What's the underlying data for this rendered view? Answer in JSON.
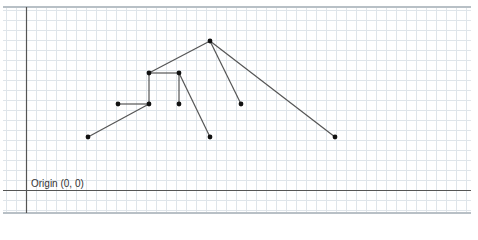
{
  "diagram": {
    "type": "tree-on-graph-paper",
    "origin_label": "Origin (0, 0)",
    "colors": {
      "grid_minor": "#dfe5ea",
      "grid_major": "#c9d2d9",
      "axis": "#555555",
      "border": "#b8c0c6",
      "edge": "#555555",
      "node": "#111111"
    },
    "grid": {
      "left": 3,
      "top": 7,
      "right": 471,
      "bottom": 213,
      "cell": 10
    },
    "axes": {
      "x": 26,
      "y": 190
    },
    "nodes": [
      {
        "id": "A",
        "x": 210,
        "y": 41
      },
      {
        "id": "B",
        "x": 149,
        "y": 73
      },
      {
        "id": "C",
        "x": 179,
        "y": 73
      },
      {
        "id": "D",
        "x": 118,
        "y": 104
      },
      {
        "id": "E",
        "x": 149,
        "y": 104
      },
      {
        "id": "F",
        "x": 179,
        "y": 104
      },
      {
        "id": "G",
        "x": 241,
        "y": 104
      },
      {
        "id": "H",
        "x": 88,
        "y": 137
      },
      {
        "id": "I",
        "x": 210,
        "y": 137
      },
      {
        "id": "J",
        "x": 335,
        "y": 137
      }
    ],
    "edges": [
      [
        "A",
        "B"
      ],
      [
        "A",
        "G"
      ],
      [
        "A",
        "J"
      ],
      [
        "B",
        "C"
      ],
      [
        "B",
        "E"
      ],
      [
        "C",
        "F"
      ],
      [
        "C",
        "I"
      ],
      [
        "E",
        "D"
      ],
      [
        "E",
        "H"
      ]
    ]
  }
}
